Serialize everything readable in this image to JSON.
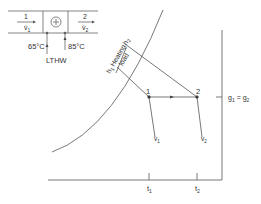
{
  "duct": {
    "inlet_label": "1",
    "inlet_flow": "v̇",
    "inlet_flow_sub": "1",
    "outlet_label": "2",
    "outlet_flow": "v̇",
    "outlet_flow_sub": "2",
    "heater_symbol": "+",
    "flow_in_temp": "65°C",
    "flow_out_temp": "85°C",
    "heat_source": "LTHW"
  },
  "chart": {
    "heating_load_line1": "Heating",
    "heating_load_line2": "load",
    "h1": "h",
    "h1_sub": "1",
    "h2": "h",
    "h2_sub": "2",
    "point1": "1",
    "point2": "2",
    "v1": "v",
    "v1_sub": "1",
    "v2": "v",
    "v2_sub": "2",
    "g_label": "g",
    "g_sub1": "1",
    "g_eq": " = g",
    "g_sub2": "2",
    "t1": "t",
    "t1_sub": "1",
    "t2": "t",
    "t2_sub": "2"
  },
  "colors": {
    "line": "#555555",
    "text": "#333333"
  }
}
